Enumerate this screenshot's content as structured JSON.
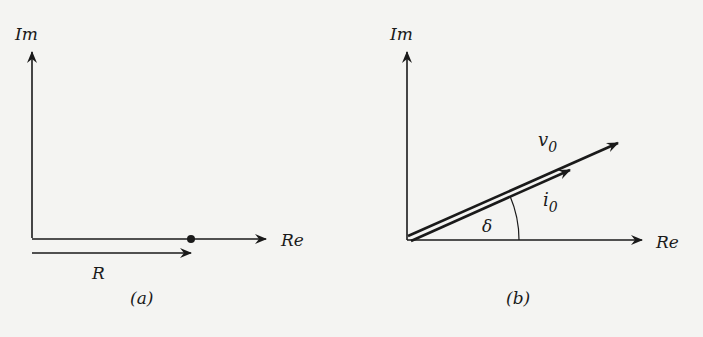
{
  "panel_a": {
    "axis_y_label": "Im",
    "axis_x_label": "Re",
    "vector_label": "R",
    "caption": "(a)"
  },
  "panel_b": {
    "axis_y_label": "Im",
    "axis_x_label": "Re",
    "vector_v_label": "v",
    "vector_v_sub": "0",
    "vector_i_label": "i",
    "vector_i_sub": "0",
    "angle_label": "δ",
    "caption": "(b)"
  },
  "colors": {
    "ink": "#1a1a1a",
    "paper": "#f4f4f2"
  }
}
